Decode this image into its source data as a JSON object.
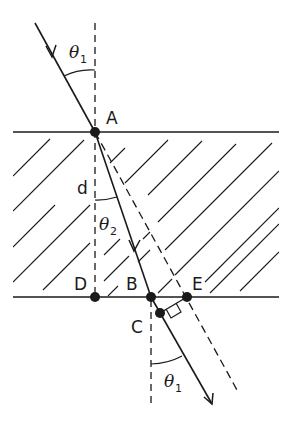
{
  "diagram": {
    "type": "refraction-through-slab",
    "colors": {
      "ink": "#1a1a1a",
      "background": "#ffffff"
    },
    "points": {
      "A": {
        "label": "A"
      },
      "B": {
        "label": "B"
      },
      "C": {
        "label": "C"
      },
      "D": {
        "label": "D"
      },
      "E": {
        "label": "E"
      }
    },
    "labels": {
      "thickness": "d",
      "angle_incident": {
        "symbol": "θ",
        "subscript": "1"
      },
      "angle_refracted": {
        "symbol": "θ",
        "subscript": "2"
      },
      "angle_emergent": {
        "symbol": "θ",
        "subscript": "1"
      }
    }
  }
}
